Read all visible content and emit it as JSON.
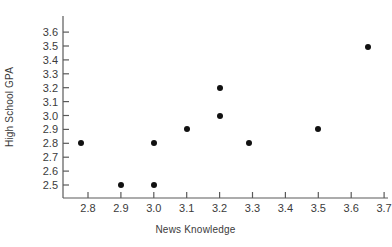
{
  "chart_data": {
    "type": "scatter",
    "title": "",
    "xlabel": "News Knowledge",
    "ylabel": "High School GPA",
    "xlim": [
      2.75,
      3.72
    ],
    "ylim": [
      2.44,
      3.63
    ],
    "xticks": [
      "2.8",
      "2.9",
      "3.0",
      "3.1",
      "3.2",
      "3.3",
      "3.4",
      "3.5",
      "3.6",
      "3.7"
    ],
    "yticks": [
      "2.5",
      "2.6",
      "2.7",
      "2.8",
      "2.9",
      "3.0",
      "3.1",
      "3.2",
      "3.3",
      "3.4",
      "3.5",
      "3.6"
    ],
    "xtick_values": [
      2.8,
      2.9,
      3.0,
      3.1,
      3.2,
      3.3,
      3.4,
      3.5,
      3.6,
      3.7
    ],
    "ytick_values": [
      2.5,
      2.6,
      2.7,
      2.8,
      2.9,
      3.0,
      3.1,
      3.2,
      3.3,
      3.4,
      3.5,
      3.6
    ],
    "grid": false,
    "legend": null,
    "marker_color": "#111111",
    "axis_color": "#5a5a5a",
    "points": [
      {
        "x": 2.78,
        "y": 2.8
      },
      {
        "x": 2.9,
        "y": 2.5
      },
      {
        "x": 3.0,
        "y": 2.5
      },
      {
        "x": 3.0,
        "y": 2.8
      },
      {
        "x": 3.1,
        "y": 2.9
      },
      {
        "x": 3.2,
        "y": 3.2
      },
      {
        "x": 3.2,
        "y": 3.0
      },
      {
        "x": 3.29,
        "y": 2.8
      },
      {
        "x": 3.5,
        "y": 2.9
      },
      {
        "x": 3.65,
        "y": 3.49
      }
    ],
    "x": [
      2.78,
      2.9,
      3.0,
      3.0,
      3.1,
      3.2,
      3.2,
      3.29,
      3.5,
      3.65
    ],
    "values": [
      2.8,
      2.5,
      2.5,
      2.8,
      2.9,
      3.2,
      3.0,
      2.8,
      2.9,
      3.49
    ]
  }
}
